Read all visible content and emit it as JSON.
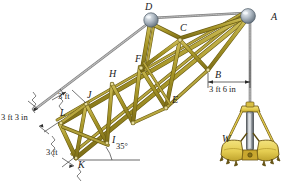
{
  "figure": {
    "joint_labels": [
      {
        "id": "A",
        "x": 271,
        "y": 12
      },
      {
        "id": "B",
        "x": 215,
        "y": 75
      },
      {
        "id": "C",
        "x": 180,
        "y": 26
      },
      {
        "id": "D",
        "x": 148,
        "y": 7
      },
      {
        "id": "E",
        "x": 173,
        "y": 100
      },
      {
        "id": "F",
        "x": 140,
        "y": 57
      },
      {
        "id": "H",
        "x": 114,
        "y": 73
      },
      {
        "id": "I",
        "x": 113,
        "y": 139
      },
      {
        "id": "J",
        "x": 88,
        "y": 95
      },
      {
        "id": "K",
        "x": 79,
        "y": 164
      },
      {
        "id": "L",
        "x": 62,
        "y": 114
      },
      {
        "id": "W",
        "x": 222,
        "y": 139
      }
    ],
    "dimensions": [
      {
        "id": "dim-3ft-top",
        "text": "3 ft",
        "x": 58,
        "y": 95
      },
      {
        "id": "dim-3ft3in",
        "text": "3 ft 3 in",
        "x": 2,
        "y": 117
      },
      {
        "id": "dim-3ft-bottom",
        "text": "3 ft",
        "x": 47,
        "y": 152
      },
      {
        "id": "dim-3ft6in",
        "text": "3 ft 6 in",
        "x": 210,
        "y": 90
      },
      {
        "id": "angle-35",
        "text": "35°",
        "x": 116,
        "y": 147
      }
    ],
    "colors": {
      "member_fill": "#a59429",
      "member_fill_light": "#c8b84f",
      "member_outline": "#5c5010",
      "cable": "#9a9a9a",
      "cable_dark": "#6e6e6e",
      "pulley": "#b9c3cc",
      "pulley_dark": "#6e7a86",
      "bucket_fill": "#e8d25c",
      "bucket_outline": "#6a5410",
      "bucket_shadow": "#c9ab35",
      "text": "#1a1a1a"
    }
  }
}
